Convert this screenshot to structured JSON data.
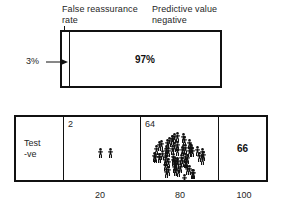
{
  "figure": {
    "annotations": {
      "false_reassurance_rate_label": "False reassurance\nrate",
      "predictive_value_negative_label": "Predictive value\nnegative",
      "false_reassurance_rate_value": "3%",
      "predictive_value_negative_value": "97%"
    },
    "top_panel": {
      "sliver_name": "false-reassurance-rate-band",
      "sliver_share_percent": 3,
      "main_name": "predictive-value-negative-band",
      "main_share_percent": 97,
      "main_value_text": "97%"
    },
    "bottom_table": {
      "row_label": "Test\n-ve",
      "cells": [
        {
          "name": "disease-positive-cell",
          "count_text": "2",
          "count": 2,
          "icons": 2
        },
        {
          "name": "disease-negative-cell",
          "count_text": "64",
          "count": 64,
          "icons": 64
        }
      ],
      "total_text": "66",
      "total": 66
    },
    "axis": {
      "ticks": [
        "20",
        "80",
        "100"
      ],
      "values": [
        20,
        80,
        100
      ]
    },
    "colors": {
      "stroke": "#111111",
      "text": "#262626",
      "background": "#ffffff"
    }
  },
  "chart_data": {
    "type": "table",
    "categories": [
      "False reassurance rate",
      "Predictive value negative"
    ],
    "values": [
      3,
      97
    ],
    "series": [
      {
        "name": "Percentage of test-negative group",
        "values": [
          3,
          97
        ]
      },
      {
        "name": "People (icon count)",
        "values": [
          2,
          64
        ]
      }
    ],
    "annotations": [
      "3%",
      "97%",
      "2",
      "64",
      "66"
    ],
    "xlabel": "",
    "ylabel": "",
    "xticklabels": [
      "20",
      "80",
      "100"
    ],
    "xlim": [
      0,
      100
    ],
    "grid": false,
    "legend": "none"
  }
}
